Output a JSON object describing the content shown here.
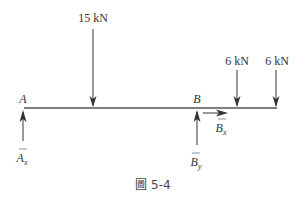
{
  "diagram": {
    "type": "free-body-diagram",
    "beam": {
      "x1": 24,
      "x2": 277,
      "y": 108,
      "color": "#555555"
    },
    "points": [
      {
        "id": "A",
        "label": "A",
        "x": 23
      },
      {
        "id": "B",
        "label": "B",
        "x": 197
      }
    ],
    "loads": [
      {
        "label": "15 kN",
        "x": 93,
        "direction": "down",
        "top": 28
      },
      {
        "label": "6 kN",
        "x": 237,
        "direction": "down",
        "top": 70
      },
      {
        "label": "6 kN",
        "x": 276,
        "direction": "down",
        "top": 70
      }
    ],
    "reactions": [
      {
        "symbol": "A",
        "subscript": "x",
        "direction": "up",
        "x": 23
      },
      {
        "symbol": "B",
        "subscript": "y",
        "direction": "up",
        "x": 197
      },
      {
        "symbol": "B",
        "subscript": "x",
        "direction": "right",
        "x": 203
      }
    ],
    "caption": "圖 5-4"
  },
  "labels": {
    "load_15": "15 kN",
    "load_6a": "6 kN",
    "load_6b": "6 kN",
    "point_a": "A",
    "point_b": "B",
    "ax_sym": "A",
    "ax_sub": "x",
    "by_sym": "B",
    "by_sub": "y",
    "bx_sym": "B",
    "bx_sub": "x",
    "caption": "圖 5-4"
  }
}
